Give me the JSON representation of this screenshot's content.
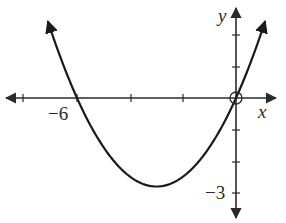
{
  "chart_data": {
    "type": "line",
    "title": "",
    "xlabel": "x",
    "ylabel": "y",
    "function": "y = (1/3)x(x + 6)",
    "x_tick_labels": [
      {
        "value": -6,
        "label": "−6"
      }
    ],
    "y_tick_labels": [
      {
        "value": -3,
        "label": "−3"
      }
    ],
    "x_tick_step": 2,
    "y_tick_step": 1,
    "xlim": [
      -8.7,
      1.8
    ],
    "ylim": [
      -3.8,
      3.1
    ],
    "grid": false,
    "legend": null,
    "annotations": [
      {
        "type": "open-circle",
        "x": 0,
        "y": 0
      }
    ],
    "x_intercepts": [
      -6,
      0
    ],
    "vertex": [
      -3,
      -3
    ],
    "series": [
      {
        "name": "parabola",
        "x": [
          -7.1,
          -6.5,
          -6,
          -5.5,
          -5,
          -4.5,
          -4,
          -3.5,
          -3,
          -2.5,
          -2,
          -1.5,
          -1,
          -0.5,
          0,
          0.5,
          1.1
        ],
        "values": [
          2.6,
          1.08,
          0,
          -0.92,
          -1.67,
          -2.25,
          -2.67,
          -2.92,
          -3,
          -2.92,
          -2.67,
          -2.25,
          -1.67,
          -0.92,
          0,
          1.08,
          2.6
        ]
      }
    ]
  },
  "labels": {
    "x_axis": "x",
    "y_axis": "y",
    "x_tick_neg6": "−6",
    "y_tick_neg3": "−3"
  },
  "style": {
    "curve_color": "#1a1a1a",
    "axis_color": "#2a2a2a"
  }
}
